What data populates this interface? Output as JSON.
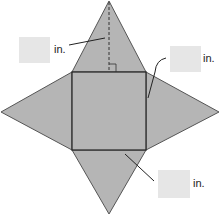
{
  "diagram": {
    "type": "square pyramid net",
    "fill_color": "#b3b3b3",
    "stroke_color": "#555555",
    "labels": [
      {
        "id": "slant-height",
        "unit": "in.",
        "value": ""
      },
      {
        "id": "base-side",
        "unit": "in.",
        "value": ""
      },
      {
        "id": "triangle-area",
        "unit": "in.",
        "value": ""
      }
    ]
  }
}
